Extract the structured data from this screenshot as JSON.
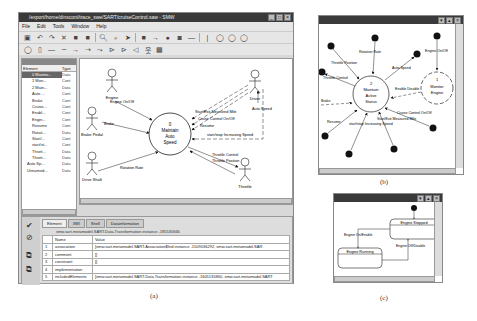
{
  "window_a": {
    "title": "/export/home/dinsconi/trace_swe/SART/cruiseControl.saw - SMW",
    "menu": [
      "File",
      "Edit",
      "Tools",
      "Window",
      "Help"
    ],
    "toolbar1_icons": [
      "save-icon",
      "undo-icon",
      "redo-icon",
      "cut-icon",
      "copy-icon",
      "paste-icon",
      "zoom-in-icon",
      "zoom-out-icon",
      "pointer-icon",
      "rectangle-icon",
      "arrow-icon",
      "dot-icon",
      "state-icon",
      "line-icon",
      "bar-icon",
      "circle-icon",
      "circle-icon",
      "circle-icon"
    ],
    "toolbar2_icons": [
      "ellipse-icon",
      "note-icon",
      "line-icon",
      "dashed-line-icon",
      "arrow-icon",
      "dashed-arrow-icon",
      "actor-link-icon",
      "include-icon",
      "extend-icon",
      "generalize-icon",
      "actor-icon",
      "box-icon"
    ],
    "tree": {
      "header": "Element",
      "col_name": "Element",
      "col_type": "Type",
      "rows": [
        {
          "name": "0 Maintai...",
          "type": "Data",
          "selected": true
        },
        {
          "name": "1 Mon...",
          "type": "Cont"
        },
        {
          "name": "2 Main...",
          "type": "Data"
        },
        {
          "name": "Auto ...",
          "type": "Cont"
        },
        {
          "name": "Brake",
          "type": "Cont"
        },
        {
          "name": "Cruise...",
          "type": "Cont"
        },
        {
          "name": "Enabl...",
          "type": "Cont"
        },
        {
          "name": "Engin...",
          "type": "Cont"
        },
        {
          "name": "Resume",
          "type": "Cont"
        },
        {
          "name": "Rotati...",
          "type": "Data"
        },
        {
          "name": "Start/...",
          "type": "Cont"
        },
        {
          "name": "start/st...",
          "type": "Cont"
        },
        {
          "name": "Thrott...",
          "type": "Data"
        },
        {
          "name": "Thrott...",
          "type": "Data"
        },
        {
          "name": "Auto Sp...",
          "type": "Data"
        },
        {
          "name": "Unnamed...",
          "type": "Data"
        }
      ]
    },
    "diagram": {
      "process": {
        "id": "0",
        "label": [
          "0",
          "Maintain",
          "Auto",
          "Speed"
        ]
      },
      "actors": [
        "Engine",
        "Brake Pedal",
        "Drive Shaft",
        "Driver",
        "Throttle"
      ],
      "flows": [
        "Engine On/Off",
        "Brake",
        "Rotation Rate",
        "Start/Exit Measured Mile",
        "Cruise Control On/Off",
        "Resume",
        "start/stop Increasing Speed",
        "Auto Speed",
        "Throttle Control",
        "Throttle Position"
      ]
    },
    "properties": {
      "tabs": [
        "Element",
        "XMI",
        "Shell",
        "Datainformation"
      ],
      "active_tab": "Element",
      "caption": "smw.sart.metamodel.SART.Data.Transformation instance -185530666",
      "columns": [
        "Name",
        "Value"
      ],
      "rows": [
        {
          "num": "1",
          "name": "association",
          "value": "[smw.sart.metamodel.SART.Association$Ind instance -1509036292, smw.sart.metamodel.SAR"
        },
        {
          "num": "2",
          "name": "comment",
          "value": "[]"
        },
        {
          "num": "3",
          "name": "constraint",
          "value": "[]"
        },
        {
          "num": "4",
          "name": "implementation",
          "value": ""
        },
        {
          "num": "5",
          "name": "includedElements",
          "value": "[smw.sart.metamodel.SART.Data.Transformation instance -1605135860, smw.sart.metamodel.SART"
        }
      ]
    },
    "caption": "(a)"
  },
  "window_b": {
    "processes": [
      {
        "label": [
          "2",
          "Maintain",
          "Active",
          "Status"
        ]
      },
      {
        "label": [
          "1",
          "Monitor",
          "Engine"
        ]
      }
    ],
    "flows": [
      "Throttle Position",
      "Rotation Rate",
      "Auto Speed",
      "Engine On/Off",
      "Throttle Control",
      "Enable Disable",
      "Brake",
      "Cruise Control On/Off",
      "Resume",
      "Start/Exit Measured Mile",
      "start/stop Increasing Speed"
    ],
    "caption": "(b)"
  },
  "window_c": {
    "states": [
      "Engine Stopped",
      "Engine Running"
    ],
    "transitions": [
      "Engine On/Enable",
      "Engine Off/Disable"
    ],
    "caption": "(c)"
  }
}
